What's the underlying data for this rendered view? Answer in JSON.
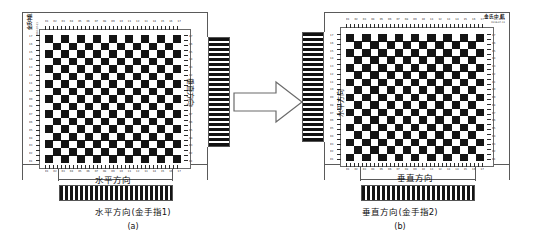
{
  "figure": {
    "type": "two-panel-diagram"
  },
  "panel_a": {
    "label": "(a)",
    "caption": "水平方向(金手指1)",
    "board_bottom_label": "水平方向",
    "board_side_label": "垂直方向",
    "corner_label_line1": "金氏中航",
    "corner_label_line2": "XH-1024",
    "corner_micro": "2016-07-11",
    "connector_position": "right",
    "checker": {
      "cols": 17,
      "rows": 17,
      "dark": "#141414",
      "light": "#ffffff"
    },
    "top_ticks": [
      "01",
      "02",
      "03",
      "04",
      "05",
      "06",
      "07",
      "08",
      "09",
      "10",
      "11",
      "12",
      "13",
      "14",
      "15",
      "16",
      "17"
    ],
    "bottom_ticks": [
      "01",
      "02",
      "03",
      "04",
      "05",
      "06",
      "07",
      "08",
      "09",
      "10",
      "11",
      "12",
      "13",
      "14",
      "15",
      "16",
      "17"
    ],
    "left_ticks": [
      "17",
      "16",
      "15",
      "14",
      "13",
      "12",
      "11",
      "10",
      "09",
      "08",
      "07",
      "06",
      "05",
      "04",
      "03",
      "02",
      "01"
    ],
    "right_ticks": [
      "17",
      "16",
      "15",
      "14",
      "13",
      "12",
      "11",
      "10",
      "09",
      "08",
      "07",
      "06",
      "05",
      "04",
      "03",
      "02",
      "01"
    ]
  },
  "panel_b": {
    "label": "(b)",
    "caption": "垂直方向(金手指2)",
    "board_bottom_label": "垂直方向",
    "board_side_label": "水平方向",
    "titleblock_main": "金氏中航",
    "titleblock_sub": "XH-1024",
    "titleblock_date": "2016-07-11",
    "connector_position": "left",
    "checker": {
      "cols": 17,
      "rows": 17,
      "dark": "#141414",
      "light": "#ffffff"
    },
    "top_ticks": [
      "01",
      "02",
      "03",
      "04",
      "05",
      "06",
      "07",
      "08",
      "09",
      "10",
      "11",
      "12",
      "13",
      "14",
      "15",
      "16",
      "17"
    ],
    "bottom_ticks": [
      "01",
      "02",
      "03",
      "04",
      "05",
      "06",
      "07",
      "08",
      "09",
      "10",
      "11",
      "12",
      "13",
      "14",
      "15",
      "16",
      "17"
    ],
    "left_ticks": [
      "17",
      "16",
      "15",
      "14",
      "13",
      "12",
      "11",
      "10",
      "09",
      "08",
      "07",
      "06",
      "05",
      "04",
      "03",
      "02",
      "01"
    ],
    "right_ticks": [
      "17",
      "16",
      "15",
      "14",
      "13",
      "12",
      "11",
      "10",
      "09",
      "08",
      "07",
      "06",
      "05",
      "04",
      "03",
      "02",
      "01"
    ]
  },
  "arrow": {
    "name": "transform-arrow",
    "direction": "right",
    "stroke": "#6b6b6b",
    "fill": "#ffffff"
  },
  "colors": {
    "board_outline": "#5a5a5a",
    "checker_dark": "#141414",
    "page_background": "#ffffff",
    "text": "#111111"
  }
}
